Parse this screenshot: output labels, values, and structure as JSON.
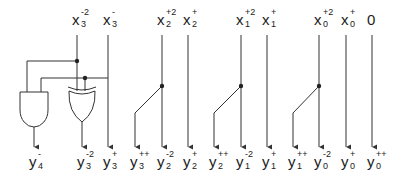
{
  "diagram": {
    "type": "logic circuit schematic",
    "inputs": [
      {
        "id": "x3m2",
        "base": "x",
        "sup": "-2",
        "sub": "3",
        "x": 77
      },
      {
        "id": "x3m",
        "base": "x",
        "sup": "-",
        "sub": "3",
        "x": 108
      },
      {
        "id": "x2p2",
        "base": "x",
        "sup": "+2",
        "sub": "2",
        "x": 162
      },
      {
        "id": "x2p",
        "base": "x",
        "sup": "+",
        "sub": "2",
        "x": 188
      },
      {
        "id": "x1p2",
        "base": "x",
        "sup": "+2",
        "sub": "1",
        "x": 241
      },
      {
        "id": "x1p",
        "base": "x",
        "sup": "+",
        "sub": "1",
        "x": 267
      },
      {
        "id": "x0p2",
        "base": "x",
        "sup": "+2",
        "sub": "0",
        "x": 319
      },
      {
        "id": "x0p",
        "base": "x",
        "sup": "+",
        "sub": "0",
        "x": 346
      },
      {
        "id": "zero",
        "base": "0",
        "sup": "",
        "sub": "",
        "x": 372
      }
    ],
    "outputs": [
      {
        "id": "y4m",
        "base": "y",
        "sup": "-",
        "sub": "4",
        "x": 34
      },
      {
        "id": "y3m2",
        "base": "y",
        "sup": "-2",
        "sub": "3",
        "x": 82
      },
      {
        "id": "y3p",
        "base": "y",
        "sup": "+",
        "sub": "3",
        "x": 108
      },
      {
        "id": "y3pp",
        "base": "y",
        "sup": "++",
        "sub": "3",
        "x": 135
      },
      {
        "id": "y2m2",
        "base": "y",
        "sup": "-2",
        "sub": "2",
        "x": 162
      },
      {
        "id": "y2p",
        "base": "y",
        "sup": "+",
        "sub": "2",
        "x": 188
      },
      {
        "id": "y2pp",
        "base": "y",
        "sup": "++",
        "sub": "2",
        "x": 214
      },
      {
        "id": "y1m2",
        "base": "y",
        "sup": "-2",
        "sub": "1",
        "x": 241
      },
      {
        "id": "y1p",
        "base": "y",
        "sup": "+",
        "sub": "1",
        "x": 267
      },
      {
        "id": "y1pp",
        "base": "y",
        "sup": "++",
        "sub": "1",
        "x": 293
      },
      {
        "id": "y0m2",
        "base": "y",
        "sup": "-2",
        "sub": "0",
        "x": 319
      },
      {
        "id": "y0p",
        "base": "y",
        "sup": "+",
        "sub": "0",
        "x": 346
      },
      {
        "id": "y0pp",
        "base": "y",
        "sup": "++",
        "sub": "0",
        "x": 372
      }
    ],
    "gates": [
      {
        "type": "AND",
        "inputs": [
          "x3m2",
          "x3m"
        ],
        "output": "y4m"
      },
      {
        "type": "XOR",
        "inputs": [
          "x3m2",
          "x3m"
        ],
        "output": "y3m2"
      }
    ],
    "branches": [
      {
        "from": "x2p2",
        "to": "y3pp"
      },
      {
        "from": "x1p2",
        "to": "y2pp"
      },
      {
        "from": "x0p2",
        "to": "y1pp"
      }
    ],
    "colors": {
      "line": "#333333",
      "text": "#222222",
      "background": "#ffffff"
    }
  }
}
